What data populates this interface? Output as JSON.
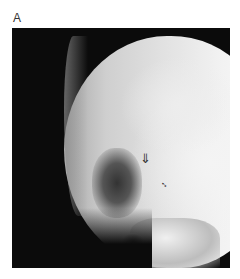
{
  "figure": {
    "panel_label": "A",
    "image_description": "Lateral skull radiograph",
    "annotations": [
      {
        "type": "open-arrow",
        "glyph": "⇓"
      },
      {
        "type": "small-double-arrow",
        "glyph": "↕"
      }
    ],
    "colors": {
      "background": "#ffffff",
      "film": "#0b0b0b",
      "bone": "#f2f2f2"
    }
  }
}
